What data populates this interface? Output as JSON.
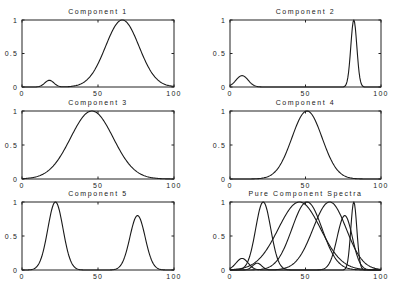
{
  "figure_title": "Pure Component Spectra",
  "chart_data": [
    {
      "type": "line",
      "title": "Component 1",
      "xlabel": "",
      "ylabel": "",
      "xlim": [
        0,
        100
      ],
      "ylim": [
        0,
        1
      ],
      "xticks": [
        "0",
        "50",
        "100"
      ],
      "yticks": [
        "0",
        "0.5",
        "1"
      ],
      "grid": false,
      "peaks": [
        {
          "center": 18,
          "height": 0.1,
          "width": 3
        },
        {
          "center": 66,
          "height": 1.0,
          "width": 11
        }
      ]
    },
    {
      "type": "line",
      "title": "Component 2",
      "xlabel": "",
      "ylabel": "",
      "xlim": [
        0,
        100
      ],
      "ylim": [
        0,
        1
      ],
      "xticks": [
        "0",
        "50",
        "100"
      ],
      "yticks": [
        "0",
        "0.5",
        "1"
      ],
      "grid": false,
      "peaks": [
        {
          "center": 8,
          "height": 0.17,
          "width": 4
        },
        {
          "center": 82,
          "height": 1.0,
          "width": 2
        }
      ]
    },
    {
      "type": "line",
      "title": "Component 3",
      "xlabel": "",
      "ylabel": "",
      "xlim": [
        0,
        100
      ],
      "ylim": [
        0,
        1
      ],
      "xticks": [
        "0",
        "50",
        "100"
      ],
      "yticks": [
        "0",
        "0.5",
        "1"
      ],
      "grid": false,
      "peaks": [
        {
          "center": 46,
          "height": 1.0,
          "width": 14
        }
      ]
    },
    {
      "type": "line",
      "title": "Component 4",
      "xlabel": "",
      "ylabel": "",
      "xlim": [
        0,
        100
      ],
      "ylim": [
        0,
        1
      ],
      "xticks": [
        "0",
        "50",
        "100"
      ],
      "yticks": [
        "0",
        "0.5",
        "1"
      ],
      "grid": false,
      "peaks": [
        {
          "center": 51,
          "height": 1.0,
          "width": 10
        }
      ]
    },
    {
      "type": "line",
      "title": "Component 5",
      "xlabel": "",
      "ylabel": "",
      "xlim": [
        0,
        100
      ],
      "ylim": [
        0,
        1
      ],
      "xticks": [
        "0",
        "50",
        "100"
      ],
      "yticks": [
        "0",
        "0.5",
        "1"
      ],
      "grid": false,
      "peaks": [
        {
          "center": 22,
          "height": 1.0,
          "width": 5
        },
        {
          "center": 76,
          "height": 0.8,
          "width": 5
        }
      ]
    },
    {
      "type": "line",
      "title": "Pure Component Spectra",
      "xlabel": "",
      "ylabel": "",
      "xlim": [
        0,
        100
      ],
      "ylim": [
        0,
        1
      ],
      "xticks": [
        "0",
        "50",
        "100"
      ],
      "yticks": [
        "0",
        "0.5",
        "1"
      ],
      "grid": false,
      "overlay_of": [
        0,
        1,
        2,
        3,
        4
      ]
    }
  ],
  "layout": {
    "panels": [
      {
        "x": 22,
        "y": 20,
        "w": 152,
        "h": 67
      },
      {
        "x": 230,
        "y": 20,
        "w": 151,
        "h": 67
      },
      {
        "x": 22,
        "y": 111,
        "w": 152,
        "h": 68
      },
      {
        "x": 230,
        "y": 111,
        "w": 151,
        "h": 68
      },
      {
        "x": 22,
        "y": 202,
        "w": 152,
        "h": 68
      },
      {
        "x": 230,
        "y": 202,
        "w": 151,
        "h": 68
      }
    ],
    "line_color": "#1a1a1a"
  }
}
